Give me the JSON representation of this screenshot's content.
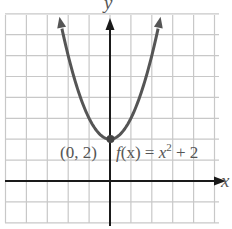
{
  "chart_data": {
    "type": "line",
    "title": "",
    "function_label": "f(x) = x² + 2",
    "function_label_parts": {
      "f": "f",
      "x_paren": "(x)",
      "eq": " = ",
      "x": "x",
      "exp": "2",
      "rest": " + 2"
    },
    "xlabel": "x",
    "ylabel": "y",
    "xlim": [
      -5,
      5
    ],
    "ylim": [
      -2,
      8
    ],
    "grid": true,
    "grid_step": 1,
    "tick_labels_shown": false,
    "series": [
      {
        "name": "f(x) = x^2 + 2",
        "x": [
          -2.4,
          -2,
          -1.5,
          -1,
          -0.5,
          0,
          0.5,
          1,
          1.5,
          2,
          2.4
        ],
        "y": [
          7.76,
          6,
          4.25,
          3,
          2.25,
          2,
          2.25,
          3,
          4.25,
          6,
          7.76
        ],
        "arrows_at_ends": true
      }
    ],
    "annotations": [
      {
        "type": "point",
        "x": 0,
        "y": 2,
        "label": "(0, 2)"
      }
    ]
  },
  "colors": {
    "grid": "#c8c8c8",
    "axis": "#1a1a1a",
    "curve": "#555555",
    "text": "#555555"
  }
}
